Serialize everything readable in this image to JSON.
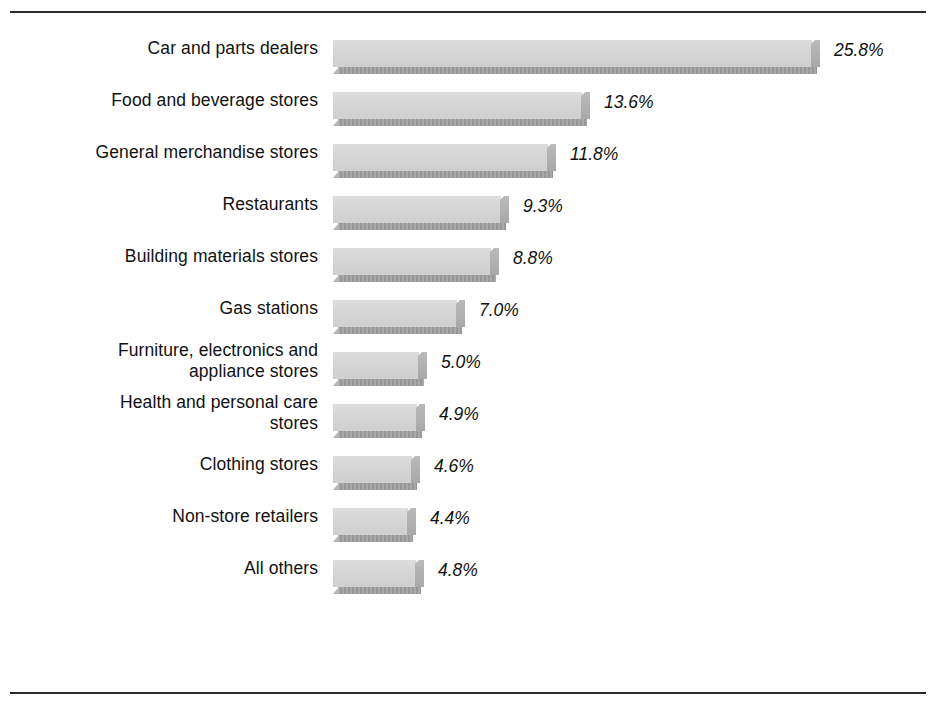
{
  "figure": {
    "width": 936,
    "height": 707,
    "background": "#ffffff",
    "rule_color": "#2b2b2b",
    "bar_face_color": "#d6d6d6",
    "bar_side_color": "#b0b0b0",
    "bar_shadow_color": "#9f9f9f",
    "text_color": "#111111"
  },
  "chart_data": {
    "type": "bar",
    "orientation": "horizontal",
    "title": "",
    "subtitle": "",
    "xlabel": "",
    "ylabel": "",
    "grid": false,
    "legend": null,
    "value_suffix": "%",
    "xlim": [
      0,
      25.8
    ],
    "categories": [
      "Car and parts dealers",
      "Food and beverage stores",
      "General merchandise stores",
      "Restaurants",
      "Building materials stores",
      "Gas stations",
      "Furniture, electronics and\nappliance stores",
      "Health and personal care\nstores",
      "Clothing stores",
      "Non-store retailers",
      "All others"
    ],
    "values": [
      25.8,
      13.6,
      11.8,
      9.3,
      8.8,
      7.0,
      5.0,
      4.9,
      4.6,
      4.4,
      4.8
    ],
    "value_labels": [
      "25.8%",
      "13.6%",
      "11.8%",
      "9.3%",
      "8.8%",
      "7.0%",
      "5.0%",
      "4.9%",
      "4.6%",
      "4.4%",
      "4.8%"
    ]
  }
}
